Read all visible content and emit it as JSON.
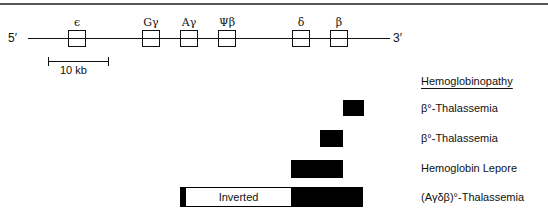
{
  "diagram": {
    "five_prime": "5′",
    "three_prime": "3′",
    "genes": [
      {
        "label": "ϵ"
      },
      {
        "label": "Gγ"
      },
      {
        "label": "Aγ"
      },
      {
        "label": "Ψβ"
      },
      {
        "label": "δ"
      },
      {
        "label": "β"
      }
    ],
    "scale_bar": {
      "label": "10 kb"
    }
  },
  "legend": {
    "header": "Hemoglobinopathy",
    "rows": [
      {
        "label": "β°-Thalassemia"
      },
      {
        "label": "β°-Thalassemia"
      },
      {
        "label": "Hemoglobin Lepore"
      },
      {
        "label": "(Aγδβ)°-Thalassemia",
        "inverted_label": "Inverted"
      }
    ]
  }
}
